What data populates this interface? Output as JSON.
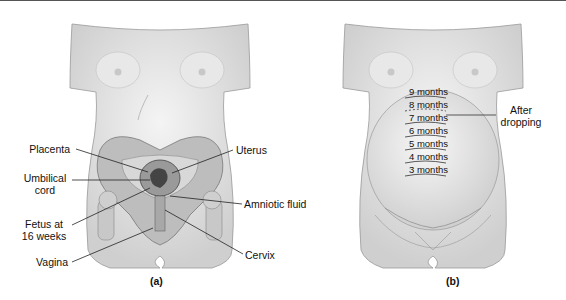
{
  "panel_a": {
    "caption": "(a)",
    "labels": {
      "placenta": "Placenta",
      "umbilical_cord_1": "Umbilical",
      "umbilical_cord_2": "cord",
      "fetus_1": "Fetus at",
      "fetus_2": "16 weeks",
      "vagina": "Vagina",
      "uterus": "Uterus",
      "amniotic_fluid": "Amniotic fluid",
      "cervix": "Cervix"
    }
  },
  "panel_b": {
    "caption": "(b)",
    "fundal_heights": [
      "9 months",
      "8 months",
      "7 months",
      "6 months",
      "5 months",
      "4 months",
      "3 months"
    ],
    "after_dropping_1": "After",
    "after_dropping_2": "dropping"
  },
  "colors": {
    "skin": "#e4e4e4",
    "outline": "#8a8a8a",
    "pelvis": "#b9b9b9",
    "text": "#111111"
  }
}
